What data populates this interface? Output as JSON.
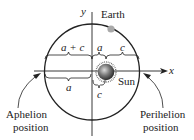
{
  "diagram": {
    "axes": {
      "x_label": "x",
      "y_label": "y"
    },
    "bodies": {
      "earth": "Earth",
      "sun": "Sun"
    },
    "distances": {
      "top_left": "a + c",
      "top_mid": "a",
      "top_right": "c",
      "bottom_left": "a",
      "bottom_sun": "c"
    },
    "positions": {
      "aphelion": [
        "Aphelion",
        "position"
      ],
      "perihelion": [
        "Perihelion",
        "position"
      ]
    },
    "colors": {
      "ellipse": "#222222",
      "earth": "#a9a9a9",
      "sun": "#555555"
    }
  }
}
